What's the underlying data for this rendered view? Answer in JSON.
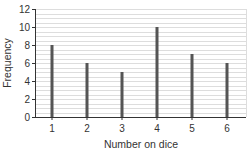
{
  "chart_data": {
    "type": "bar",
    "title": "",
    "xlabel": "Number on dice",
    "ylabel": "Frequency",
    "categories": [
      "1",
      "2",
      "3",
      "4",
      "5",
      "6"
    ],
    "values": [
      8,
      6,
      5,
      10,
      7,
      6
    ],
    "ylim": [
      0,
      12
    ],
    "yticks": [
      0,
      2,
      4,
      6,
      8,
      10,
      12
    ],
    "grid": true,
    "minor_grid_step": 0.5,
    "legend": null,
    "colors": {
      "bar": "#555555",
      "grid": "#dddddd",
      "axis": "#333333"
    }
  }
}
